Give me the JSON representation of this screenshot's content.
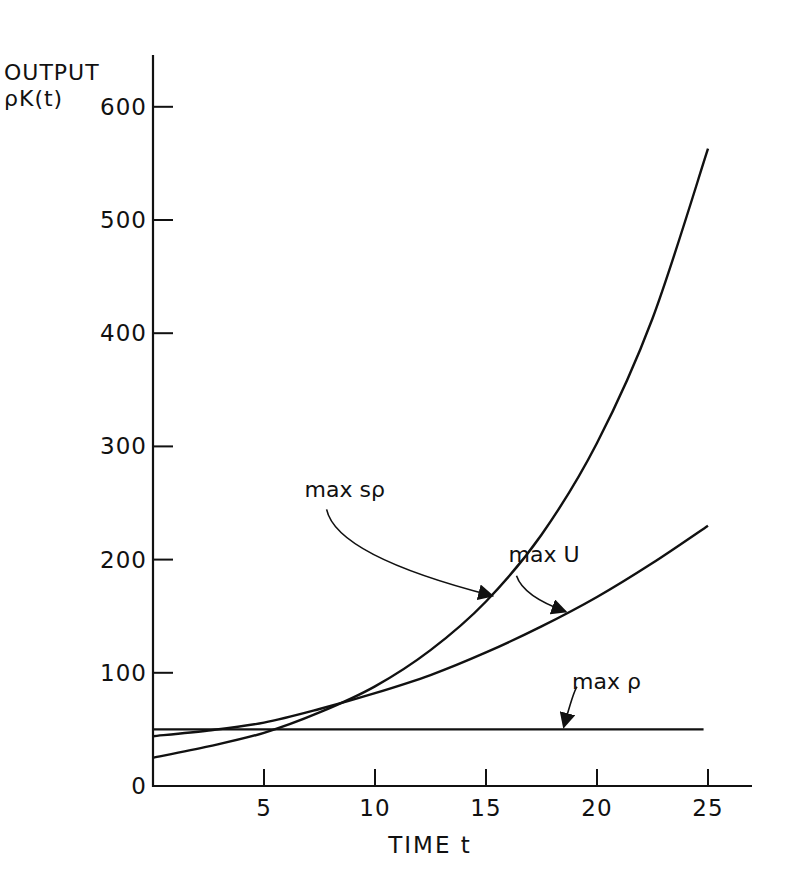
{
  "chart_data": {
    "type": "line",
    "title": "",
    "ylabel_line1": "OUTPUT",
    "ylabel_line2": "ρK(t)",
    "xlabel": "TIME t",
    "xlim": [
      0,
      26.5
    ],
    "ylim": [
      0,
      650
    ],
    "x_ticks": [
      5,
      10,
      15,
      20,
      25
    ],
    "x_tick_labels": [
      "5",
      "10",
      "15",
      "20",
      "25"
    ],
    "y_ticks": [
      0,
      100,
      200,
      300,
      400,
      500,
      600
    ],
    "y_tick_labels": [
      "0",
      "100",
      "200",
      "300",
      "400",
      "500",
      "600"
    ],
    "grid": false,
    "legend": "inline annotations with arrows",
    "series": [
      {
        "name": "max sρ",
        "x": [
          0,
          2.5,
          5,
          7.5,
          10,
          12.5,
          15,
          17.5,
          20,
          22.5,
          25
        ],
        "values": [
          25,
          35,
          47,
          65,
          88,
          120,
          163,
          222,
          303,
          413,
          563
        ],
        "label_pos": {
          "x": 13.0,
          "y": 255
        },
        "arrow_to": {
          "x": 15.3,
          "y": 168
        }
      },
      {
        "name": "max U",
        "x": [
          0,
          2.5,
          5,
          7.5,
          10,
          12.5,
          15,
          17.5,
          20,
          22.5,
          25
        ],
        "values": [
          44,
          49,
          56,
          68,
          82,
          98,
          118,
          141,
          167,
          197,
          230
        ],
        "label_pos": {
          "x": 17.5,
          "y": 198
        },
        "arrow_to": {
          "x": 18.6,
          "y": 154
        }
      },
      {
        "name": "max ρ",
        "x": [
          0,
          24.8
        ],
        "values": [
          50,
          50
        ],
        "label_pos": {
          "x": 20.0,
          "y": 86
        },
        "arrow_to": {
          "x": 18.5,
          "y": 52
        }
      }
    ]
  }
}
